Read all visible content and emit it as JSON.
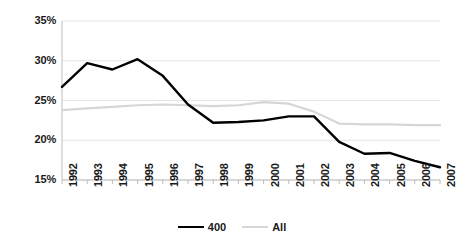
{
  "chart_data": {
    "type": "line",
    "title": "",
    "xlabel": "",
    "ylabel": "",
    "grid": true,
    "legend_position": "bottom",
    "ylim": [
      15,
      35
    ],
    "ytick_values": [
      15,
      20,
      25,
      30,
      35
    ],
    "ytick_labels": [
      "15%",
      "20%",
      "25%",
      "30%",
      "35%"
    ],
    "categories": [
      "1992",
      "1993",
      "1994",
      "1995",
      "1996",
      "1997",
      "1998",
      "1999",
      "2000",
      "2001",
      "2002",
      "2003",
      "2004",
      "2005",
      "2006",
      "2007"
    ],
    "series": [
      {
        "name": "400",
        "color": "#000000",
        "values": [
          26.7,
          29.7,
          28.9,
          30.2,
          28.1,
          24.5,
          22.2,
          22.3,
          22.5,
          23.0,
          23.0,
          19.8,
          18.3,
          18.4,
          17.4,
          16.6
        ]
      },
      {
        "name": "All",
        "color": "#d6d6d6",
        "values": [
          23.8,
          24.0,
          24.2,
          24.4,
          24.5,
          24.4,
          24.3,
          24.4,
          24.8,
          24.6,
          23.6,
          22.1,
          22.0,
          22.0,
          21.9,
          21.9
        ]
      }
    ]
  },
  "legend": {
    "items": [
      {
        "label": "400",
        "style": "s400"
      },
      {
        "label": "All",
        "style": "sall"
      }
    ]
  },
  "axis": {
    "y_tick_labels": [
      "35%",
      "30%",
      "25%",
      "20%",
      "15%"
    ],
    "x_tick_labels": [
      "1992",
      "1993",
      "1994",
      "1995",
      "1996",
      "1997",
      "1998",
      "1999",
      "2000",
      "2001",
      "2002",
      "2003",
      "2004",
      "2005",
      "2006",
      "2007"
    ]
  },
  "colors": {
    "series_400": "#000000",
    "series_all": "#d6d6d6",
    "gridline": "#e4e4e4",
    "axis": "#bdbdbd",
    "text": "#1a1a1a",
    "background": "#ffffff"
  }
}
